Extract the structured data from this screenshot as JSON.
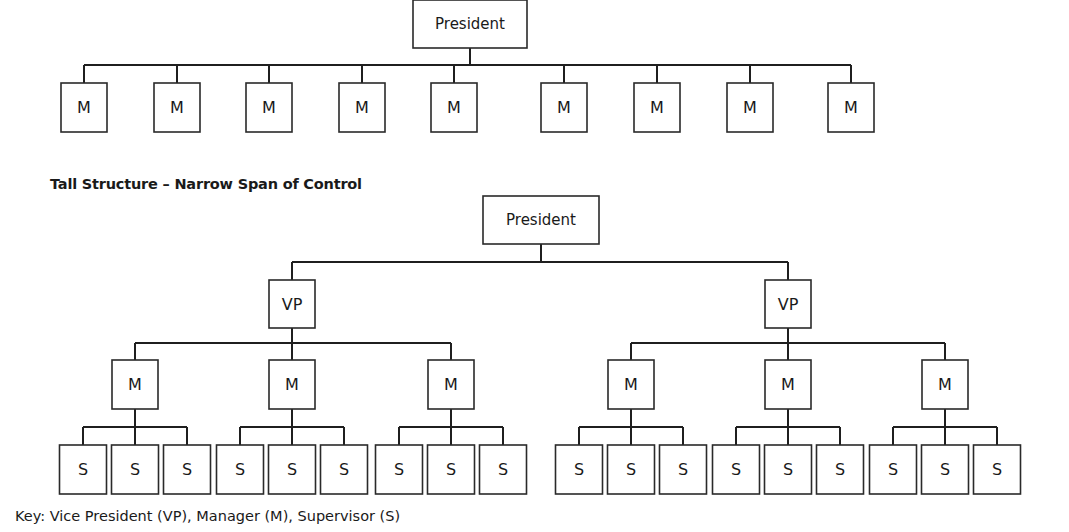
{
  "flat_structure": {
    "root": {
      "label": "President"
    },
    "children": [
      {
        "label": "M"
      },
      {
        "label": "M"
      },
      {
        "label": "M"
      },
      {
        "label": "M"
      },
      {
        "label": "M"
      },
      {
        "label": "M"
      },
      {
        "label": "M"
      },
      {
        "label": "M"
      },
      {
        "label": "M"
      }
    ]
  },
  "tall_structure": {
    "title": "Tall Structure – Narrow Span of Control",
    "root": {
      "label": "President"
    },
    "vps": [
      {
        "label": "VP",
        "managers": [
          {
            "label": "M",
            "supervisors": [
              {
                "label": "S"
              },
              {
                "label": "S"
              },
              {
                "label": "S"
              }
            ]
          },
          {
            "label": "M",
            "supervisors": [
              {
                "label": "S"
              },
              {
                "label": "S"
              },
              {
                "label": "S"
              }
            ]
          },
          {
            "label": "M",
            "supervisors": [
              {
                "label": "S"
              },
              {
                "label": "S"
              },
              {
                "label": "S"
              }
            ]
          }
        ]
      },
      {
        "label": "VP",
        "managers": [
          {
            "label": "M",
            "supervisors": [
              {
                "label": "S"
              },
              {
                "label": "S"
              },
              {
                "label": "S"
              }
            ]
          },
          {
            "label": "M",
            "supervisors": [
              {
                "label": "S"
              },
              {
                "label": "S"
              },
              {
                "label": "S"
              }
            ]
          },
          {
            "label": "M",
            "supervisors": [
              {
                "label": "S"
              },
              {
                "label": "S"
              },
              {
                "label": "S"
              }
            ]
          }
        ]
      }
    ]
  },
  "key": "Key: Vice President (VP), Manager (M), Supervisor (S)"
}
